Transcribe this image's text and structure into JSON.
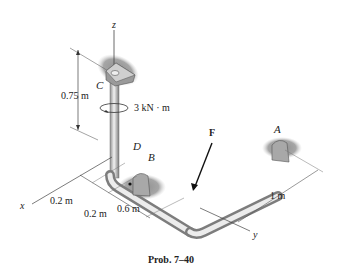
{
  "figure": {
    "caption": "Prob. 7–40",
    "axes": {
      "x": "x",
      "y": "y",
      "z": "z"
    },
    "points": {
      "A": "A",
      "B": "B",
      "C": "C",
      "D": "D"
    },
    "force": "F",
    "moment": "3 kN · m",
    "dimensions": {
      "height_CD": "0.75 m",
      "x_seg1": "0.2 m",
      "x_seg2": "0.2 m",
      "x_seg3": "0.6 m",
      "y_len": "1 m"
    },
    "colors": {
      "pipe_light": "#e6e6e6",
      "pipe_dark": "#8a8a8a",
      "shadow": "#9a9a9a",
      "line": "#333333"
    }
  }
}
